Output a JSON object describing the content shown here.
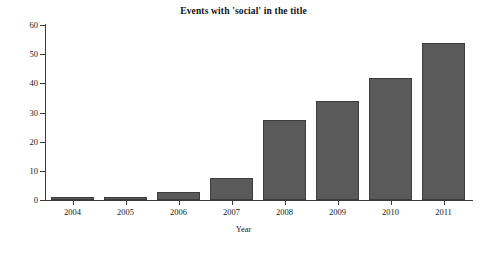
{
  "chart_data": {
    "type": "bar",
    "title": "Events with 'social' in the title",
    "xlabel": "Year",
    "ylabel": "Events",
    "categories": [
      "2004",
      "2005",
      "2006",
      "2007",
      "2008",
      "2009",
      "2010",
      "2011"
    ],
    "values": [
      1,
      1,
      2.7,
      7.6,
      27.5,
      33.8,
      41.7,
      53.7
    ],
    "ylim": [
      0,
      60
    ],
    "yticks": [
      0,
      10,
      20,
      30,
      40,
      50,
      60
    ],
    "ytick_labels": [
      "0",
      "10",
      "20",
      "30",
      "40",
      "50",
      "60"
    ],
    "grid": false,
    "legend": null,
    "bar_color": "#5a5a5a",
    "bar_edge_color": "#3d3d3d",
    "background_color": "#ffffff",
    "axis_color": "#3b3b3b"
  }
}
